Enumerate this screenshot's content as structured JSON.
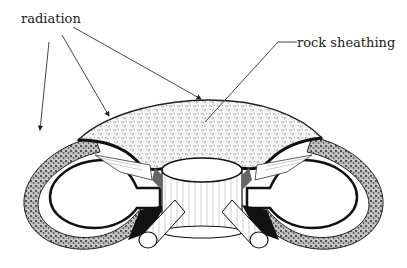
{
  "labels": {
    "radiation": "radiation",
    "rock_sheathing": "rock sheathing"
  },
  "colors": {
    "ink": "#1a1a1a",
    "rock_fill": "#f2f2f2",
    "background": "#ffffff"
  },
  "parts": [
    "rock sheathing (outer crust)",
    "toroidal ring (two cross-section loops)",
    "central hub cylinder",
    "radial spokes",
    "docking tubes"
  ]
}
